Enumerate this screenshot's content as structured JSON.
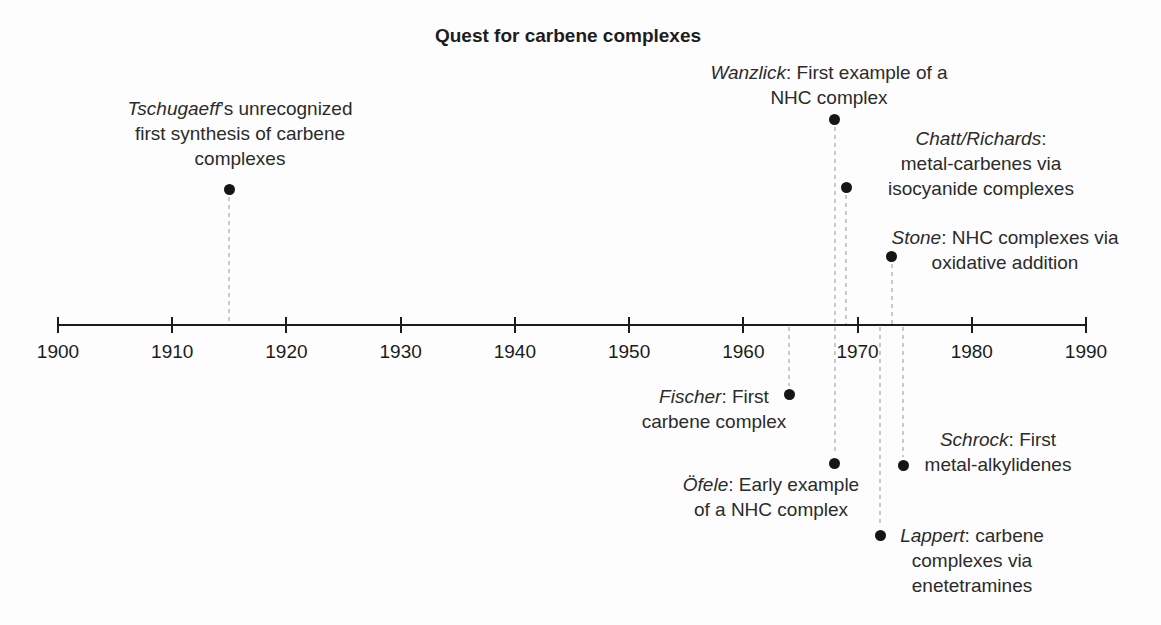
{
  "figure": {
    "title": "Quest for carbene complexes",
    "background": "#fdfdfd",
    "text_color": "#2b2b2b",
    "axis_color": "#1c1c1c",
    "dash_color": "#c9c9c9",
    "dot_color": "#151515"
  },
  "timeline": {
    "axis": {
      "y": 325,
      "x_start": 58,
      "x_end": 1086,
      "year_start": 1900,
      "year_end": 1990,
      "tick_step": 10,
      "tick_labels": [
        "1900",
        "1910",
        "1920",
        "1930",
        "1940",
        "1950",
        "1960",
        "1970",
        "1980",
        "1990"
      ]
    },
    "events": [
      {
        "id": "tschugaeff",
        "year": 1915,
        "side": "above",
        "dot_y": 189,
        "label": {
          "cx": 240,
          "top": 96,
          "lines": [
            [
              {
                "t": "Tschugaeff",
                "i": true
              },
              {
                "t": "’s unrecognized"
              }
            ],
            [
              {
                "t": "first synthesis of carbene"
              }
            ],
            [
              {
                "t": "complexes"
              }
            ]
          ]
        }
      },
      {
        "id": "wanzlick",
        "year": 1968,
        "side": "above",
        "dot_y": 119,
        "label": {
          "cx": 829,
          "top": 60,
          "lines": [
            [
              {
                "t": "Wanzlick",
                "i": true
              },
              {
                "t": ": First example of a"
              }
            ],
            [
              {
                "t": "NHC complex"
              }
            ]
          ]
        }
      },
      {
        "id": "chatt-richards",
        "year": 1969,
        "side": "above",
        "dot_y": 187,
        "label": {
          "cx": 981,
          "top": 126,
          "lines": [
            [
              {
                "t": "Chatt/Richards",
                "i": true
              },
              {
                "t": ":"
              }
            ],
            [
              {
                "t": "metal-carbenes via"
              }
            ],
            [
              {
                "t": "isocyanide complexes"
              }
            ]
          ]
        }
      },
      {
        "id": "stone",
        "year": 1973,
        "side": "above",
        "dot_y": 256,
        "label": {
          "cx": 1005,
          "top": 225,
          "lines": [
            [
              {
                "t": "Stone",
                "i": true
              },
              {
                "t": ": NHC complexes via"
              }
            ],
            [
              {
                "t": "oxidative addition"
              }
            ]
          ]
        }
      },
      {
        "id": "fischer",
        "year": 1964,
        "side": "below",
        "dot_y": 394,
        "label": {
          "cx": 714,
          "top": 384,
          "lines": [
            [
              {
                "t": "Fischer",
                "i": true
              },
              {
                "t": ": First"
              }
            ],
            [
              {
                "t": "carbene complex"
              }
            ]
          ]
        }
      },
      {
        "id": "ofele",
        "year": 1968,
        "side": "below",
        "dot_y": 463,
        "label": {
          "cx": 771,
          "top": 472,
          "lines": [
            [
              {
                "t": "Öfele",
                "i": true
              },
              {
                "t": ": Early example"
              }
            ],
            [
              {
                "t": "of a NHC complex"
              }
            ]
          ]
        }
      },
      {
        "id": "schrock",
        "year": 1974,
        "side": "below",
        "dot_y": 465,
        "label": {
          "cx": 998,
          "top": 427,
          "lines": [
            [
              {
                "t": "Schrock",
                "i": true
              },
              {
                "t": ": First"
              }
            ],
            [
              {
                "t": "metal-alkylidenes"
              }
            ]
          ]
        }
      },
      {
        "id": "lappert",
        "year": 1972,
        "side": "below",
        "dot_y": 535,
        "label": {
          "cx": 972,
          "top": 523,
          "lines": [
            [
              {
                "t": "Lappert",
                "i": true
              },
              {
                "t": ": carbene"
              }
            ],
            [
              {
                "t": "complexes via"
              }
            ],
            [
              {
                "t": "enetetramines"
              }
            ]
          ]
        }
      }
    ]
  }
}
